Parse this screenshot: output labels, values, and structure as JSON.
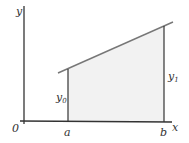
{
  "diagram": {
    "type": "area-under-line",
    "colors": {
      "axis": "#333333",
      "line": "#666666",
      "fill": "#f2f2f2",
      "text": "#333333"
    },
    "labels": {
      "y_axis": "y",
      "x_axis": "x",
      "origin": "0",
      "a": "a",
      "b": "b",
      "y0": "y",
      "y0_sub": "0",
      "y1": "y",
      "y1_sub": "1"
    }
  }
}
